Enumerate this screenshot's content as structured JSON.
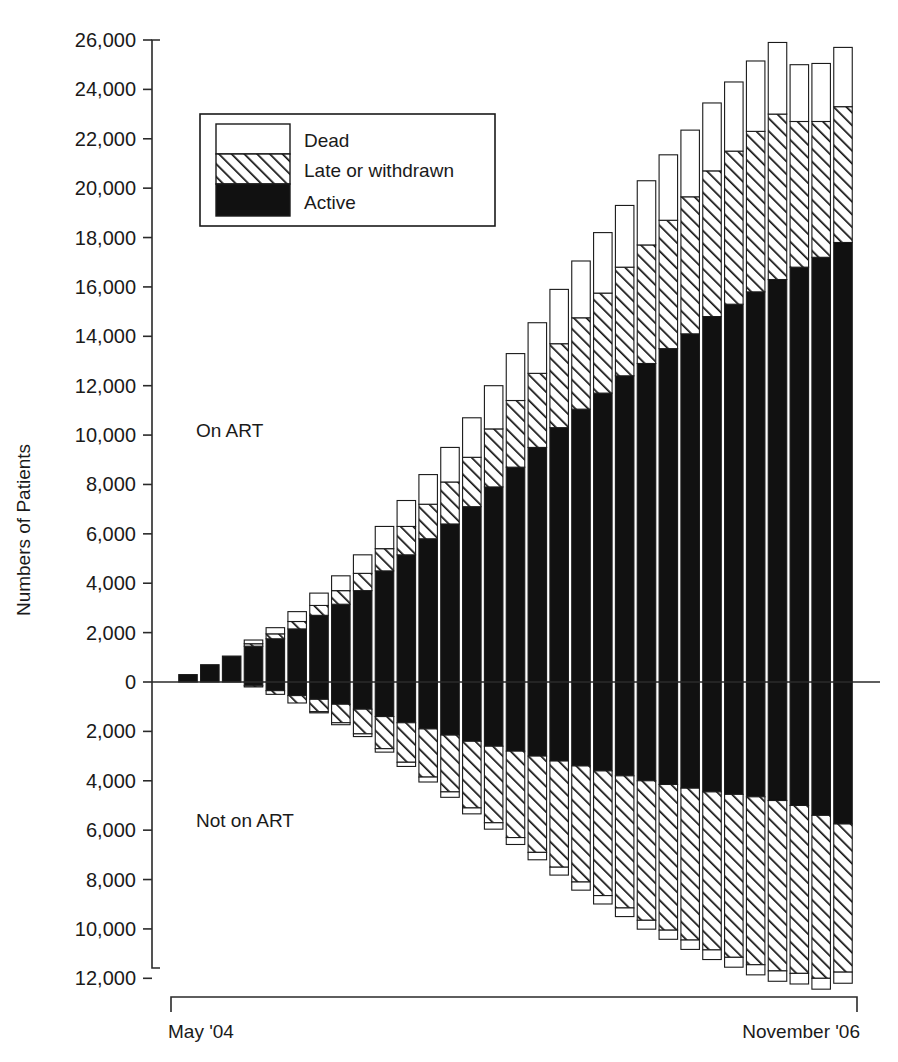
{
  "chart_data": {
    "type": "bar",
    "subtype": "stacked-diverging-column",
    "title": "",
    "xlabel": "",
    "ylabel": "Numbers of Patients",
    "ylim": [
      -12000,
      26000
    ],
    "grid": false,
    "legend_position": "upper-left-inside",
    "y_ticks_positive": [
      "0",
      "2,000",
      "4,000",
      "6,000",
      "8,000",
      "10,000",
      "12,000",
      "14,000",
      "16,000",
      "18,000",
      "20,000",
      "22,000",
      "24,000",
      "26,000"
    ],
    "y_ticks_negative": [
      "2,000",
      "4,000",
      "6,000",
      "8,000",
      "10,000",
      "12,000"
    ],
    "y_tick_note": "Below the zero line the axis labels are shown as positive magnitudes",
    "x_range_start": "May '04",
    "x_range_end": "November '06",
    "categories": [
      "May '04",
      "Jun '04",
      "Jul '04",
      "Aug '04",
      "Sep '04",
      "Oct '04",
      "Nov '04",
      "Dec '04",
      "Jan '05",
      "Feb '05",
      "Mar '05",
      "Apr '05",
      "May '05",
      "Jun '05",
      "Jul '05",
      "Aug '05",
      "Sep '05",
      "Oct '05",
      "Nov '05",
      "Dec '05",
      "Jan '06",
      "Feb '06",
      "Mar '06",
      "Apr '06",
      "May '06",
      "Jun '06",
      "Jul '06",
      "Aug '06",
      "Sep '06",
      "Oct '06",
      "Nov '06"
    ],
    "groups": [
      {
        "name": "On ART",
        "direction": "up",
        "series": [
          {
            "name": "Active",
            "values": [
              300,
              700,
              1050,
              1450,
              1750,
              2150,
              2700,
              3150,
              3700,
              4500,
              5150,
              5800,
              6400,
              7100,
              7900,
              8700,
              9500,
              10300,
              11050,
              11700,
              12400,
              12900,
              13500,
              14100,
              14800,
              15300,
              15800,
              16300,
              16800,
              17200,
              17800
            ]
          },
          {
            "name": "Late or withdrawn",
            "values": [
              0,
              0,
              0,
              100,
              200,
              300,
              400,
              550,
              700,
              900,
              1150,
              1400,
              1700,
              2000,
              2350,
              2700,
              3000,
              3400,
              3700,
              4050,
              4400,
              4800,
              5200,
              5550,
              5900,
              6200,
              6500,
              6700,
              5900,
              5500,
              5500
            ]
          },
          {
            "name": "Dead",
            "values": [
              0,
              0,
              0,
              150,
              250,
              400,
              500,
              600,
              750,
              900,
              1050,
              1200,
              1400,
              1600,
              1750,
              1900,
              2050,
              2200,
              2300,
              2450,
              2500,
              2600,
              2650,
              2700,
              2750,
              2800,
              2850,
              2900,
              2300,
              2350,
              2400
            ]
          }
        ],
        "totals": [
          300,
          700,
          1050,
          1700,
          2200,
          2850,
          3600,
          4300,
          5150,
          6300,
          7350,
          8400,
          9500,
          10700,
          12000,
          13300,
          14550,
          15900,
          17050,
          18200,
          19300,
          20300,
          21350,
          22350,
          23450,
          24300,
          25150,
          25900,
          25000,
          25050,
          25700
        ]
      },
      {
        "name": "Not on ART",
        "direction": "down",
        "series": [
          {
            "name": "Active",
            "values": [
              0,
              0,
              0,
              150,
              350,
              550,
              700,
              900,
              1100,
              1400,
              1650,
              1900,
              2150,
              2400,
              2600,
              2800,
              3000,
              3200,
              3400,
              3600,
              3800,
              4000,
              4150,
              4300,
              4450,
              4550,
              4650,
              4800,
              5000,
              5400,
              5750
            ]
          },
          {
            "name": "Late or withdrawn",
            "values": [
              0,
              0,
              0,
              50,
              150,
              300,
              500,
              750,
              1000,
              1300,
              1600,
              1950,
              2300,
              2700,
              3100,
              3500,
              3900,
              4300,
              4700,
              5050,
              5350,
              5650,
              5900,
              6150,
              6400,
              6600,
              6800,
              6900,
              6800,
              6600,
              6000
            ]
          },
          {
            "name": "Dead",
            "values": [
              0,
              0,
              0,
              0,
              0,
              0,
              50,
              80,
              110,
              140,
              170,
              200,
              220,
              240,
              260,
              280,
              300,
              320,
              330,
              340,
              350,
              360,
              370,
              380,
              390,
              400,
              410,
              420,
              430,
              440,
              450
            ]
          }
        ],
        "totals": [
          0,
          0,
          0,
          200,
          500,
          850,
          1250,
          1730,
          2210,
          2840,
          3420,
          4050,
          4670,
          5340,
          5960,
          6580,
          7200,
          7820,
          8430,
          8990,
          9500,
          10010,
          10420,
          10830,
          11240,
          11550,
          11860,
          12120,
          12230,
          12440,
          12200
        ]
      }
    ]
  },
  "axis": {
    "y_title": "Numbers of Patients"
  },
  "legend": {
    "items": [
      {
        "label": "Dead",
        "pattern": "solid-white"
      },
      {
        "label": "Late or withdrawn",
        "pattern": "diagonal-hatch"
      },
      {
        "label": "Active",
        "pattern": "solid-black"
      }
    ]
  },
  "annotations": [
    {
      "id": "on-art",
      "text": "On ART"
    },
    {
      "id": "not-on-art",
      "text": "Not on ART"
    }
  ],
  "x_axis": {
    "start_label": "May '04",
    "end_label": "November '06"
  },
  "colors": {
    "active": "#111111",
    "dead": "#ffffff",
    "hatch_line": "#111111",
    "axis": "#2a2a2a",
    "text": "#1a1a1a"
  }
}
